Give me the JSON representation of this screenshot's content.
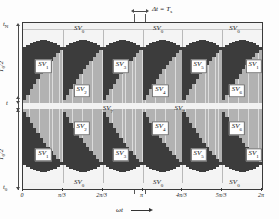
{
  "figure": {
    "colors": {
      "dark_vector": "#3c3c3c",
      "light_vector": "#b2b2b2",
      "zero_vector": "#f2f2f2",
      "frame": "#3a3a3a",
      "grid": "#b9b9b9",
      "background": "#fdfdfd"
    }
  },
  "annotations": {
    "delta_t": "Δt = T",
    "delta_t_sub": "s",
    "x_axis_label": "ωt",
    "y_top_tick": "t",
    "y_top_tick_sub": "N",
    "y_bottom_tick": "t",
    "y_bottom_tick_sub": "0",
    "y_mid_label": "t",
    "y_half_period_upper": "T",
    "y_half_period_upper_sub": "0",
    "y_half_period_upper_den": "/2",
    "y_half_period_lower": "T",
    "y_half_period_lower_sub": "0",
    "y_half_period_lower_den": "/2"
  },
  "x_axis": {
    "ticks": [
      {
        "label": "0",
        "pos": 0.0
      },
      {
        "label": "π/3",
        "pos": 0.16667
      },
      {
        "label": "2π/3",
        "pos": 0.33333
      },
      {
        "label": "π",
        "pos": 0.5
      },
      {
        "label": "4π/3",
        "pos": 0.66667
      },
      {
        "label": "5π/3",
        "pos": 0.83333
      },
      {
        "label": "2π",
        "pos": 1.0
      }
    ]
  },
  "chart_data": {
    "type": "area",
    "xlabel": "ωt",
    "ylabel": "t",
    "xlim": [
      0,
      6.283185
    ],
    "ylim": [
      0,
      1
    ],
    "grid": true,
    "legend_position": "inline-chips",
    "series": [
      {
        "name": "SV0",
        "role": "zero-vector",
        "color": "#f2f2f2",
        "placement": "outer edges (top and bottom of each half)"
      },
      {
        "name": "SV7",
        "role": "zero-vector",
        "color": "#f2f2f2",
        "placement": "centre band between the two halves"
      },
      {
        "name": "SV1",
        "role": "active-vector",
        "color": "#3c3c3c"
      },
      {
        "name": "SV2",
        "role": "active-vector",
        "color": "#b2b2b2"
      },
      {
        "name": "SV3",
        "role": "active-vector",
        "color": "#3c3c3c"
      },
      {
        "name": "SV4",
        "role": "active-vector",
        "color": "#b2b2b2"
      },
      {
        "name": "SV5",
        "role": "active-vector",
        "color": "#3c3c3c"
      },
      {
        "name": "SV6",
        "role": "active-vector",
        "color": "#b2b2b2"
      }
    ],
    "sector_boundaries": [
      "0",
      "π/3",
      "2π/3",
      "π",
      "4π/3",
      "5π/3",
      "2π"
    ],
    "switching_period_marker": {
      "label": "Δt = Ts",
      "at": "π"
    }
  },
  "region_labels": {
    "upper_band": {
      "top_zero": [
        {
          "text": "SV",
          "sub": "0",
          "x": 0.235,
          "y": 0.035
        },
        {
          "text": "SV",
          "sub": "0",
          "x": 0.565,
          "y": 0.035
        },
        {
          "text": "SV",
          "sub": "0",
          "x": 0.885,
          "y": 0.035
        }
      ],
      "dark": [
        {
          "text": "SV",
          "sub": "1",
          "x": 0.085,
          "y": 0.26
        },
        {
          "text": "SV",
          "sub": "3",
          "x": 0.41,
          "y": 0.26
        },
        {
          "text": "SV",
          "sub": "5",
          "x": 0.735,
          "y": 0.26
        },
        {
          "text": "SV",
          "sub": "1",
          "x": 0.965,
          "y": 0.26
        }
      ],
      "light": [
        {
          "text": "SV",
          "sub": "2",
          "x": 0.245,
          "y": 0.41
        },
        {
          "text": "SV",
          "sub": "4",
          "x": 0.575,
          "y": 0.41
        },
        {
          "text": "SV",
          "sub": "6",
          "x": 0.895,
          "y": 0.41
        }
      ]
    },
    "mid_zero": [
      {
        "text": "SV",
        "sub": "7",
        "x": 0.355,
        "y": 0.518
      },
      {
        "text": "SV",
        "sub": "7",
        "x": 0.655,
        "y": 0.518
      }
    ],
    "lower_band": {
      "light": [
        {
          "text": "SV",
          "sub": "2",
          "x": 0.245,
          "y": 0.635
        },
        {
          "text": "SV",
          "sub": "4",
          "x": 0.575,
          "y": 0.635
        },
        {
          "text": "SV",
          "sub": "6",
          "x": 0.895,
          "y": 0.635
        }
      ],
      "dark": [
        {
          "text": "SV",
          "sub": "1",
          "x": 0.085,
          "y": 0.795
        },
        {
          "text": "SV",
          "sub": "3",
          "x": 0.41,
          "y": 0.795
        },
        {
          "text": "SV",
          "sub": "5",
          "x": 0.735,
          "y": 0.795
        },
        {
          "text": "SV",
          "sub": "1",
          "x": 0.965,
          "y": 0.795
        }
      ],
      "bottom_zero": [
        {
          "text": "SV",
          "sub": "0",
          "x": 0.235,
          "y": 0.965
        },
        {
          "text": "SV",
          "sub": "0",
          "x": 0.565,
          "y": 0.965
        },
        {
          "text": "SV",
          "sub": "0",
          "x": 0.885,
          "y": 0.965
        }
      ]
    }
  }
}
